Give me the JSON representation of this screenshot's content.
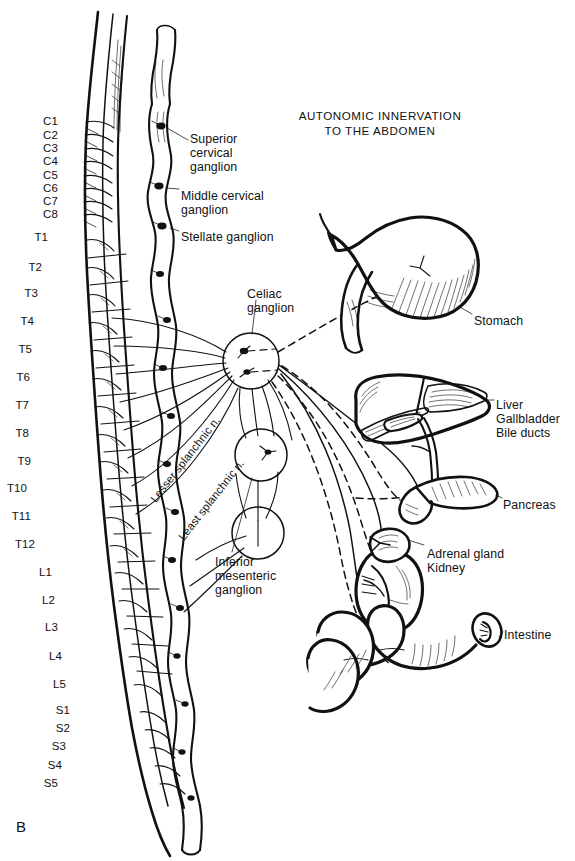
{
  "figure": {
    "panel_letter": "B",
    "title_line1": "AUTONOMIC INNERVATION",
    "title_line2": "TO THE ABDOMEN",
    "ink_color": "#111111",
    "background_color": "#ffffff"
  },
  "spinal_levels": [
    {
      "label": "C1",
      "x": 58,
      "y": 122
    },
    {
      "label": "C2",
      "x": 58,
      "y": 136
    },
    {
      "label": "C3",
      "x": 58,
      "y": 149
    },
    {
      "label": "C4",
      "x": 58,
      "y": 162
    },
    {
      "label": "C5",
      "x": 58,
      "y": 176
    },
    {
      "label": "C6",
      "x": 58,
      "y": 189
    },
    {
      "label": "C7",
      "x": 58,
      "y": 202
    },
    {
      "label": "C8",
      "x": 58,
      "y": 215
    },
    {
      "label": "T1",
      "x": 48,
      "y": 238
    },
    {
      "label": "T2",
      "x": 42,
      "y": 268
    },
    {
      "label": "T3",
      "x": 38,
      "y": 294
    },
    {
      "label": "T4",
      "x": 34,
      "y": 322
    },
    {
      "label": "T5",
      "x": 32,
      "y": 350
    },
    {
      "label": "T6",
      "x": 30,
      "y": 378
    },
    {
      "label": "T7",
      "x": 29,
      "y": 406
    },
    {
      "label": "T8",
      "x": 29,
      "y": 434
    },
    {
      "label": "T9",
      "x": 31,
      "y": 462
    },
    {
      "label": "T10",
      "x": 27,
      "y": 489
    },
    {
      "label": "T11",
      "x": 31,
      "y": 517
    },
    {
      "label": "T12",
      "x": 35,
      "y": 545
    },
    {
      "label": "L1",
      "x": 52,
      "y": 573
    },
    {
      "label": "L2",
      "x": 55,
      "y": 601
    },
    {
      "label": "L3",
      "x": 58,
      "y": 628
    },
    {
      "label": "L4",
      "x": 62,
      "y": 657
    },
    {
      "label": "L5",
      "x": 66,
      "y": 685
    },
    {
      "label": "S1",
      "x": 70,
      "y": 711
    },
    {
      "label": "S2",
      "x": 70,
      "y": 729
    },
    {
      "label": "S3",
      "x": 66,
      "y": 747
    },
    {
      "label": "S4",
      "x": 62,
      "y": 766
    },
    {
      "label": "S5",
      "x": 58,
      "y": 784
    }
  ],
  "ganglion_callouts": [
    {
      "name": "superior-cervical-ganglion",
      "lines": [
        "Superior",
        "cervical",
        "ganglion"
      ],
      "x": 190,
      "y": 133
    },
    {
      "name": "middle-cervical-ganglion",
      "lines": [
        "Middle cervical",
        "ganglion"
      ],
      "x": 181,
      "y": 190
    },
    {
      "name": "stellate-ganglion",
      "lines": [
        "Stellate ganglion"
      ],
      "x": 181,
      "y": 231
    },
    {
      "name": "celiac-ganglion",
      "lines": [
        "Celiac",
        "ganglion"
      ],
      "x": 247,
      "y": 288
    },
    {
      "name": "inferior-mesenteric-ganglion",
      "lines": [
        "Inferior",
        "mesenteric",
        "ganglion"
      ],
      "x": 215,
      "y": 556
    }
  ],
  "splanchnic_nerves": [
    {
      "name": "lesser-splanchnic-nerve",
      "label": "Lesser splanchnic n.",
      "x": 148,
      "y": 497,
      "rotate": -52
    },
    {
      "name": "least-splanchnic-nerve",
      "label": "Least splanchnic n.",
      "x": 176,
      "y": 535,
      "rotate": -52
    }
  ],
  "organs": [
    {
      "name": "stomach",
      "lines": [
        "Stomach"
      ],
      "x": 474,
      "y": 315
    },
    {
      "name": "liver-group",
      "lines": [
        "Liver",
        "Gallbladder",
        "Bile ducts"
      ],
      "x": 496,
      "y": 399
    },
    {
      "name": "pancreas",
      "lines": [
        "Pancreas"
      ],
      "x": 503,
      "y": 499
    },
    {
      "name": "kidney-group",
      "lines": [
        "Adrenal gland",
        "Kidney"
      ],
      "x": 427,
      "y": 548
    },
    {
      "name": "intestine",
      "lines": [
        "Intestine"
      ],
      "x": 504,
      "y": 629
    }
  ]
}
